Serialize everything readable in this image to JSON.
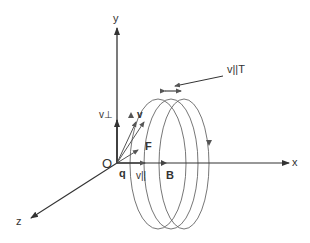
{
  "diagram": {
    "axes": {
      "x_label": "x",
      "y_label": "y",
      "z_label": "z",
      "origin_label": "O"
    },
    "labels": {
      "charge": "q",
      "velocity": "v",
      "v_perp": "v⊥",
      "v_parallel": "v||",
      "force": "F",
      "field": "B",
      "pitch": "v||T"
    },
    "colors": {
      "line": "#444444",
      "background": "#ffffff"
    }
  }
}
